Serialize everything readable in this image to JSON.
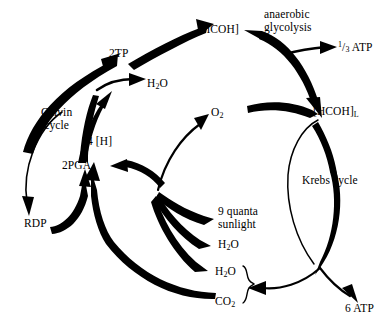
{
  "diagram": {
    "background_color": "#ffffff",
    "stroke_color": "#000000",
    "text_color": "#000000",
    "cycles": {
      "calvin": "Calvin\ncycle",
      "glycolysis": "anaerobic\nglycolysis",
      "krebs": "Krebs cycle"
    },
    "nodes": {
      "two_tp": "2TP",
      "water_top": "H",
      "water_top_sub": "2",
      "water_top_tail": "O",
      "hcoh": "[HCOH]",
      "third_atp_num": "1",
      "third_atp_den": "3",
      "third_atp_label": "ATP",
      "hcoh_l": "[HCOH]",
      "hcoh_l_sub": "L",
      "oxygen": "O",
      "oxygen_sub": "2",
      "four_h": "4 [H]",
      "two_pga": "2PGA",
      "rdp": "RDP",
      "quanta": "9 quanta\nsunlight",
      "water_mid": "H",
      "water_mid_sub": "2",
      "water_mid_tail": "O",
      "water_low": "H",
      "water_low_sub": "2",
      "water_low_tail": "O",
      "carbon_dioxide": "CO",
      "carbon_dioxide_sub": "2",
      "six_atp": "6 ATP"
    }
  }
}
